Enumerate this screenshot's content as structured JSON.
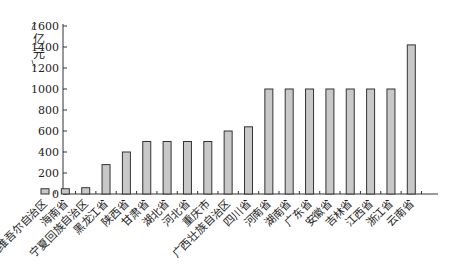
{
  "chart_data": {
    "type": "bar",
    "title": "",
    "xlabel": "",
    "ylabel": "亿元",
    "ylim": [
      0,
      1600
    ],
    "yticks": [
      0,
      200,
      400,
      600,
      800,
      1000,
      1200,
      1400,
      1600
    ],
    "grid": false,
    "categories": [
      "新疆维吾尔自治区",
      "海南省",
      "宁夏回族自治区",
      "黑龙江省",
      "陕西省",
      "甘肃省",
      "湖北省",
      "河北省",
      "重庆市",
      "广西壮族自治区",
      "四川省",
      "河南省",
      "湖南省",
      "广东省",
      "安徽省",
      "吉林省",
      "江西省",
      "浙江省",
      "云南省"
    ],
    "values": [
      50,
      50,
      60,
      280,
      400,
      500,
      500,
      500,
      500,
      600,
      640,
      1000,
      1000,
      1000,
      1000,
      1000,
      1000,
      1000,
      1420
    ],
    "bar_color": "#c8c8c8"
  }
}
